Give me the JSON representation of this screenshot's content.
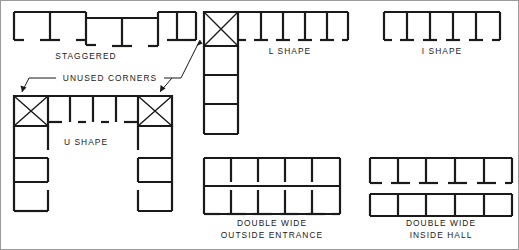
{
  "diagram": {
    "background_color": "#ffffff",
    "line_color": "#1a1a1a",
    "figures": [
      {
        "id": "staggered",
        "label": "STAGGERED",
        "label_x": 86,
        "label_y": 59,
        "bays": 6,
        "description": "Offset rows of rooms along a spine"
      },
      {
        "id": "l-shape",
        "label": "L  SHAPE",
        "label_x": 290,
        "label_y": 54,
        "bays": 8,
        "description": "Two wings meeting at a corner"
      },
      {
        "id": "i-shape",
        "label": "I  SHAPE",
        "label_x": 442,
        "label_y": 54,
        "bays": 4,
        "description": "Single straight wing"
      },
      {
        "id": "u-shape",
        "label": "U  SHAPE",
        "label_x": 86,
        "label_y": 145,
        "bays": 12,
        "description": "Three wings forming a U with two corners"
      },
      {
        "id": "double-wide-outside-entrance",
        "label_line_1": "DOUBLE   WIDE",
        "label_line_2": "OUTSIDE   ENTRANCE",
        "label_x": 272,
        "label_y": 226,
        "bays": 10,
        "description": "Two back-to-back rows of rooms entered from outside"
      },
      {
        "id": "double-wide-inside-hall",
        "label_line_1": "DOUBLE   WIDE",
        "label_line_2": "INSIDE   HALL",
        "label_x": 441,
        "label_y": 226,
        "bays": 10,
        "description": "Two rows of rooms flanking a central corridor"
      }
    ],
    "annotations": [
      {
        "id": "unused-corners",
        "text": "UNUSED   CORNERS",
        "text_x": 110,
        "text_y": 81,
        "pointer_count": 3,
        "description": "Callout marking the square corner cells crossed with an X"
      }
    ],
    "corner_marker": {
      "symbol": "X",
      "meaning": "unused corner"
    }
  }
}
